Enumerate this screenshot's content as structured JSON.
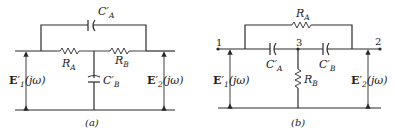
{
  "figure": {
    "panels": [
      {
        "id": "a",
        "caption": "(a)",
        "components": {
          "capacitor_top": {
            "name": "C",
            "prime": "′",
            "sub": "A"
          },
          "resistor_left": {
            "name": "R",
            "sub": "A"
          },
          "resistor_right": {
            "name": "R",
            "sub": "B"
          },
          "capacitor_shunt": {
            "name": "C",
            "prime": "′",
            "sub": "B"
          }
        },
        "input_voltage": {
          "name": "E",
          "prime": "′",
          "sub": "1",
          "arg": "(jω)"
        },
        "output_voltage": {
          "name": "E",
          "prime": "′",
          "sub": "2",
          "arg": "(jω)"
        }
      },
      {
        "id": "b",
        "caption": "(b)",
        "nodes": [
          "1",
          "3",
          "2"
        ],
        "components": {
          "resistor_top": {
            "name": "R",
            "sub": "A"
          },
          "capacitor_left": {
            "name": "C",
            "prime": "′",
            "sub": "A"
          },
          "capacitor_right": {
            "name": "C",
            "prime": "′",
            "sub": "B"
          },
          "resistor_shunt": {
            "name": "R",
            "sub": "B"
          }
        },
        "input_voltage": {
          "name": "E",
          "prime": "′",
          "sub": "1",
          "arg": "(jω)"
        },
        "output_voltage": {
          "name": "E",
          "prime": "′",
          "sub": "2",
          "arg": "(jω)"
        }
      }
    ]
  }
}
